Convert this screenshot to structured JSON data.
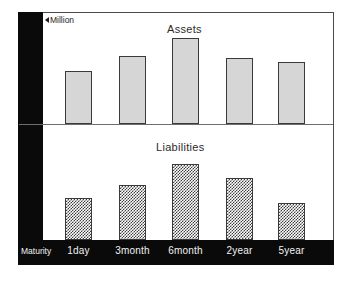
{
  "figure": {
    "unit_caret_icon": "left-triangle-icon",
    "unit_label": "Million",
    "maturity_axis_title": "Maturity"
  },
  "chart_data": {
    "type": "bar",
    "title": "",
    "xlabel": "Maturity",
    "ylabel": "Million",
    "grid": false,
    "legend": "none",
    "categories": [
      "1day",
      "3month",
      "6month",
      "2year",
      "5year"
    ],
    "panels": [
      {
        "name": "assets",
        "title": "Assets",
        "fill": "light-grey-dotted",
        "ylim": [
          0,
          100
        ],
        "values": [
          58,
          75,
          95,
          73,
          68
        ]
      },
      {
        "name": "liabilities",
        "title": "Liabilities",
        "fill": "checkerboard",
        "ylim": [
          0,
          100
        ],
        "values": [
          55,
          73,
          100,
          82,
          49
        ]
      }
    ],
    "series": [
      {
        "name": "Assets",
        "values": [
          58,
          75,
          95,
          73,
          68
        ]
      },
      {
        "name": "Liabilities",
        "values": [
          55,
          73,
          100,
          82,
          49
        ]
      }
    ]
  },
  "colors": {
    "band": "#0a0a0a",
    "frame": "#4a4a4a",
    "assets_fill": "#d6d6d6",
    "liabilities_fill": "#3f3f3f",
    "bar_outline": "#3a3a3a",
    "band_text": "#f2f2f2",
    "title_text": "#2b2b2b"
  }
}
